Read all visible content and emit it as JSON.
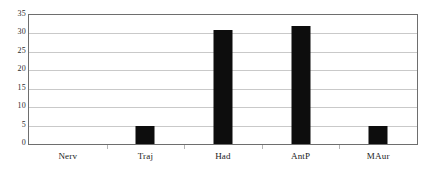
{
  "chart_data": {
    "type": "bar",
    "title": "",
    "subtitle": "",
    "xlabel": "",
    "ylabel": "",
    "categories": [
      "Nerv",
      "Traj",
      "Had",
      "AntP",
      "MAur"
    ],
    "values": [
      0,
      5,
      31,
      32,
      5
    ],
    "series": [
      {
        "name": "Count",
        "values": [
          0,
          5,
          31,
          32,
          5
        ]
      }
    ],
    "ylim": [
      0,
      35
    ],
    "yticks": [
      0,
      5,
      10,
      15,
      20,
      25,
      30,
      35
    ],
    "ytick_labels": [
      "0",
      "5",
      "10",
      "15",
      "20",
      "25",
      "30",
      "35"
    ],
    "grid": true,
    "grid_axis": "y",
    "legend": false,
    "legend_position": "none",
    "bar_color": "#0d0d0d",
    "grid_color": "#c9c9c9",
    "frame_color": "#6e6e6e",
    "background_color": "#ffffff",
    "annotations": []
  }
}
